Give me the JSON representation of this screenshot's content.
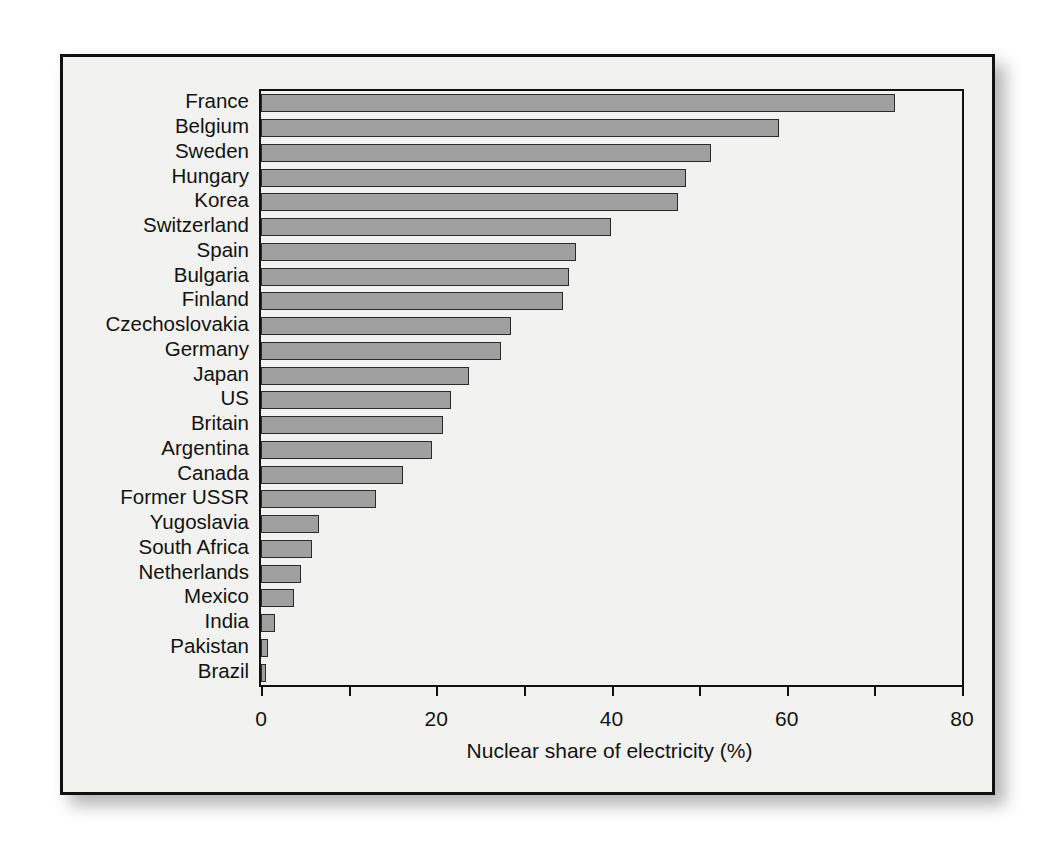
{
  "chart_data": {
    "type": "bar",
    "orientation": "horizontal",
    "title": "",
    "xlabel": "Nuclear share of electricity (%)",
    "ylabel": "",
    "xlim": [
      0,
      80
    ],
    "xticks": [
      0,
      20,
      40,
      60,
      80
    ],
    "xtick_labels": [
      "0",
      "20",
      "40",
      "60",
      "80"
    ],
    "minor_xticks": [
      10,
      30,
      50,
      70
    ],
    "grid": false,
    "legend": null,
    "categories": [
      "France",
      "Belgium",
      "Sweden",
      "Hungary",
      "Korea",
      "Switzerland",
      "Spain",
      "Bulgaria",
      "Finland",
      "Czechoslovakia",
      "Germany",
      "Japan",
      "US",
      "Britain",
      "Argentina",
      "Canada",
      "Former USSR",
      "Yugoslavia",
      "South Africa",
      "Netherlands",
      "Mexico",
      "India",
      "Pakistan",
      "Brazil"
    ],
    "values": [
      72.3,
      59.1,
      51.4,
      48.5,
      47.6,
      39.9,
      36.0,
      35.2,
      34.5,
      28.5,
      27.4,
      23.7,
      21.7,
      20.8,
      19.5,
      16.2,
      13.1,
      6.6,
      5.8,
      4.6,
      3.8,
      1.6,
      0.8,
      0.6
    ],
    "bar_fill_color": "#a0a0a0",
    "bar_edge_color": "#2b2b2b",
    "axis_color": "#111111",
    "background_color": "#f2f2f1"
  }
}
